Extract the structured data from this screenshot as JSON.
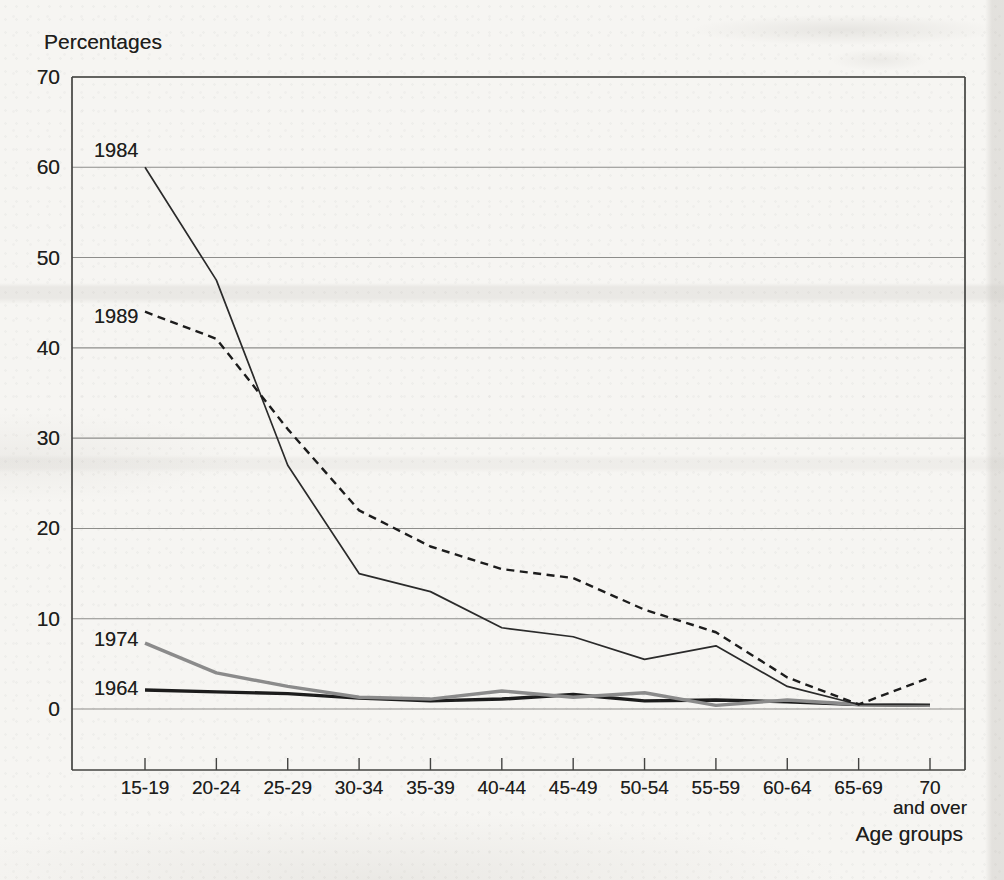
{
  "chart_data": {
    "type": "line",
    "ylabel": "Percentages",
    "xlabel": "Age groups",
    "ylim": [
      0,
      70
    ],
    "yticks": [
      0,
      10,
      20,
      30,
      40,
      50,
      60,
      70
    ],
    "grid": "horizontal gridlines at every 10 units",
    "legend_position": "inline labels at the left ends of the lines",
    "categories": [
      "15-19",
      "20-24",
      "25-29",
      "30-34",
      "35-39",
      "40-44",
      "45-49",
      "50-54",
      "55-59",
      "60-64",
      "65-69",
      "70\nand over"
    ],
    "series": [
      {
        "name": "1964",
        "style": "solid-thick",
        "color": "#1c1c1c",
        "values": [
          2.1,
          1.9,
          1.7,
          1.2,
          0.9,
          1.1,
          1.6,
          0.9,
          1.0,
          0.8,
          0.5,
          0.4
        ]
      },
      {
        "name": "1974",
        "style": "solid-thick",
        "color": "#8b8b8b",
        "values": [
          7.3,
          4.0,
          2.5,
          1.3,
          1.1,
          2.0,
          1.3,
          1.8,
          0.4,
          1.0,
          0.5,
          0.4
        ]
      },
      {
        "name": "1984",
        "style": "solid-thin",
        "color": "#2a2a2a",
        "values": [
          60,
          47.5,
          27,
          15,
          13,
          9,
          8,
          5.5,
          7,
          2.5,
          0.5,
          0.5
        ]
      },
      {
        "name": "1989",
        "style": "dashed",
        "color": "#1c1c1c",
        "values": [
          44,
          41,
          31,
          22,
          18,
          15.5,
          14.5,
          11,
          8.5,
          3.5,
          0.5,
          3.5
        ]
      }
    ]
  }
}
